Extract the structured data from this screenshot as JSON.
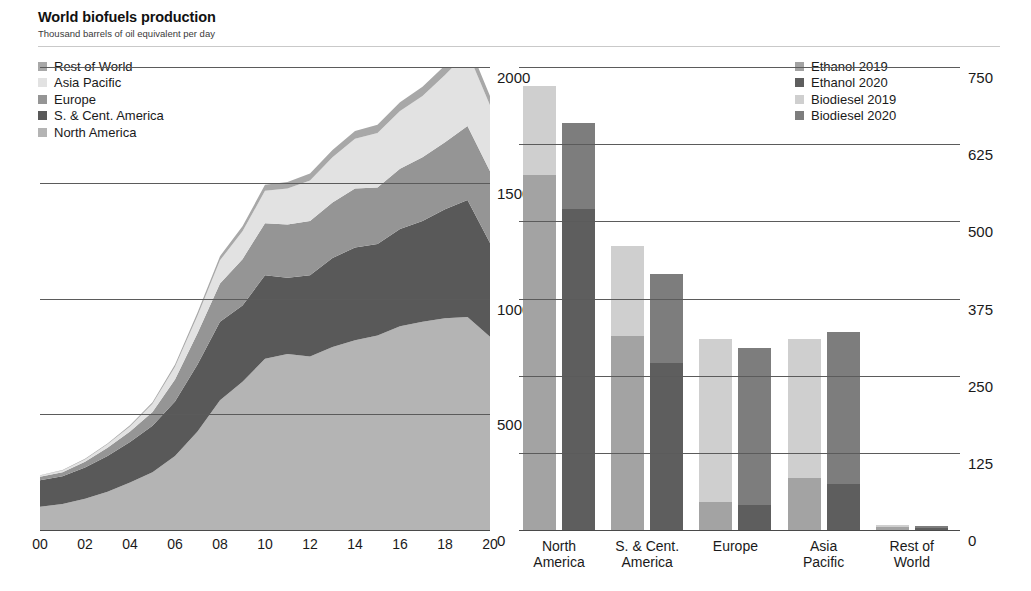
{
  "header": {
    "title": "World biofuels production",
    "subtitle": "Thousand barrels of oil equivalent per day"
  },
  "colors": {
    "rest_of_world": "#a8a8a8",
    "asia_pacific": "#e2e2e2",
    "europe": "#959595",
    "s_and_c_america": "#595959",
    "north_america": "#b4b4b4",
    "ethanol_2019": "#a3a3a3",
    "ethanol_2020": "#5e5e5e",
    "biodiesel_2019": "#cfcfcf",
    "biodiesel_2020": "#7d7d7d",
    "gridline": "#5b5b5b",
    "text": "#1a1a1a"
  },
  "left_panel": {
    "legend": [
      {
        "label": "Rest of World",
        "color": "#a8a8a8"
      },
      {
        "label": "Asia Pacific",
        "color": "#e2e2e2"
      },
      {
        "label": "Europe",
        "color": "#959595"
      },
      {
        "label": "S. & Cent. America",
        "color": "#595959"
      },
      {
        "label": "North America",
        "color": "#b4b4b4"
      }
    ],
    "yticks": [
      "0",
      "500",
      "1000",
      "1500",
      "2000"
    ],
    "xticks": [
      "00",
      "02",
      "04",
      "06",
      "08",
      "10",
      "12",
      "14",
      "16",
      "18",
      "20"
    ]
  },
  "right_panel": {
    "legend": [
      {
        "label": "Ethanol 2019",
        "color": "#a3a3a3"
      },
      {
        "label": "Ethanol 2020",
        "color": "#5e5e5e"
      },
      {
        "label": "Biodiesel 2019",
        "color": "#cfcfcf"
      },
      {
        "label": "Biodiesel 2020",
        "color": "#7d7d7d"
      }
    ],
    "yticks": [
      "0",
      "125",
      "250",
      "375",
      "500",
      "625",
      "750"
    ],
    "xticks": [
      {
        "line1": "North",
        "line2": "America"
      },
      {
        "line1": "S. & Cent.",
        "line2": "America"
      },
      {
        "line1": "Europe",
        "line2": ""
      },
      {
        "line1": "Asia",
        "line2": "Pacific"
      },
      {
        "line1": "Rest of",
        "line2": "World"
      }
    ]
  },
  "chart_data": [
    {
      "type": "area",
      "id": "world-biofuels-production-stacked-area",
      "title": "World biofuels production",
      "subtitle": "Thousand barrels of oil equivalent per day",
      "xlabel": "",
      "ylabel": "Thousand barrels of oil equivalent per day",
      "ylim": [
        0,
        2000
      ],
      "yticks": [
        0,
        500,
        1000,
        1500,
        2000
      ],
      "grid": true,
      "stacked": true,
      "legend_position": "top-left",
      "x": [
        2000,
        2001,
        2002,
        2003,
        2004,
        2005,
        2006,
        2007,
        2008,
        2009,
        2010,
        2011,
        2012,
        2013,
        2014,
        2015,
        2016,
        2017,
        2018,
        2019,
        2020
      ],
      "tick_labels": [
        "00",
        "01",
        "02",
        "03",
        "04",
        "05",
        "06",
        "07",
        "08",
        "09",
        "10",
        "11",
        "12",
        "13",
        "14",
        "15",
        "16",
        "17",
        "18",
        "19",
        "20"
      ],
      "series": [
        {
          "name": "North America",
          "color": "#b4b4b4",
          "values": [
            100,
            112,
            135,
            165,
            205,
            250,
            320,
            425,
            560,
            640,
            740,
            760,
            750,
            790,
            820,
            840,
            880,
            900,
            915,
            920,
            835
          ]
        },
        {
          "name": "S. & Cent. America",
          "color": "#595959",
          "values": [
            115,
            120,
            135,
            155,
            175,
            200,
            235,
            290,
            340,
            330,
            360,
            330,
            350,
            385,
            400,
            395,
            420,
            435,
            470,
            505,
            405
          ]
        },
        {
          "name": "Europe",
          "color": "#959595",
          "values": [
            15,
            18,
            25,
            35,
            45,
            60,
            95,
            135,
            165,
            200,
            225,
            230,
            235,
            240,
            255,
            245,
            260,
            275,
            290,
            320,
            310
          ]
        },
        {
          "name": "Asia Pacific",
          "color": "#e2e2e2",
          "values": [
            5,
            7,
            10,
            15,
            22,
            35,
            55,
            75,
            100,
            120,
            140,
            155,
            175,
            195,
            215,
            235,
            250,
            265,
            290,
            320,
            285
          ]
        },
        {
          "name": "Rest of World",
          "color": "#a8a8a8",
          "values": [
            2,
            2,
            3,
            4,
            5,
            7,
            10,
            14,
            18,
            22,
            26,
            28,
            30,
            32,
            34,
            36,
            38,
            40,
            42,
            45,
            40
          ]
        }
      ],
      "totals": [
        237,
        259,
        308,
        374,
        452,
        552,
        715,
        939,
        1183,
        1312,
        1491,
        1503,
        1540,
        1642,
        1724,
        1751,
        1848,
        1915,
        2007,
        2110,
        1875
      ]
    },
    {
      "type": "bar",
      "id": "biofuels-by-region-ethanol-biodiesel",
      "title": "",
      "xlabel": "",
      "ylabel": "Thousand barrels of oil equivalent per day",
      "ylim": [
        0,
        750
      ],
      "yticks": [
        0,
        125,
        250,
        375,
        500,
        625,
        750
      ],
      "grid": true,
      "stacked": true,
      "grouped_by": "year",
      "legend_position": "top-right",
      "categories": [
        "North America",
        "S. & Cent. America",
        "Europe",
        "Asia Pacific",
        "Rest of World"
      ],
      "groups": [
        {
          "year": "2019",
          "segments": [
            {
              "name": "Ethanol 2019",
              "color": "#a3a3a3",
              "values": [
                575,
                315,
                45,
                85,
                5
              ]
            },
            {
              "name": "Biodiesel 2019",
              "color": "#cfcfcf",
              "values": [
                145,
                145,
                265,
                225,
                3
              ]
            }
          ],
          "totals": [
            720,
            460,
            310,
            310,
            8
          ]
        },
        {
          "year": "2020",
          "segments": [
            {
              "name": "Ethanol 2020",
              "color": "#5e5e5e",
              "values": [
                520,
                270,
                40,
                75,
                4
              ]
            },
            {
              "name": "Biodiesel 2020",
              "color": "#7d7d7d",
              "values": [
                140,
                145,
                255,
                245,
                3
              ]
            }
          ],
          "totals": [
            660,
            415,
            295,
            320,
            7
          ]
        }
      ]
    }
  ]
}
